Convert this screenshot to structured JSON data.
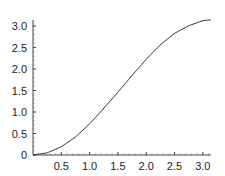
{
  "chart_data": {
    "type": "line",
    "title": "",
    "xlabel": "",
    "ylabel": "",
    "xlim": [
      0,
      3.1416
    ],
    "ylim": [
      0,
      3.1416
    ],
    "grid": false,
    "legend": null,
    "x_ticks": [
      "0.5",
      "1.0",
      "1.5",
      "2.0",
      "2.5",
      "3.0"
    ],
    "x_tick_values": [
      0.5,
      1.0,
      1.5,
      2.0,
      2.5,
      3.0
    ],
    "y_ticks": [
      "0",
      "0.5",
      "1.0",
      "1.5",
      "2.0",
      "2.5",
      "3.0"
    ],
    "y_tick_values": [
      0,
      0.5,
      1.0,
      1.5,
      2.0,
      2.5,
      3.0
    ],
    "series": [
      {
        "name": "curve",
        "color": "#333333",
        "x": [
          0,
          0.25,
          0.5,
          0.75,
          1.0,
          1.25,
          1.5,
          1.75,
          2.0,
          2.25,
          2.5,
          2.75,
          3.0,
          3.1416
        ],
        "y": [
          0,
          0.049,
          0.192,
          0.418,
          0.722,
          1.086,
          1.46,
          1.85,
          2.225,
          2.563,
          2.829,
          3.005,
          3.126,
          3.1416
        ]
      }
    ]
  }
}
